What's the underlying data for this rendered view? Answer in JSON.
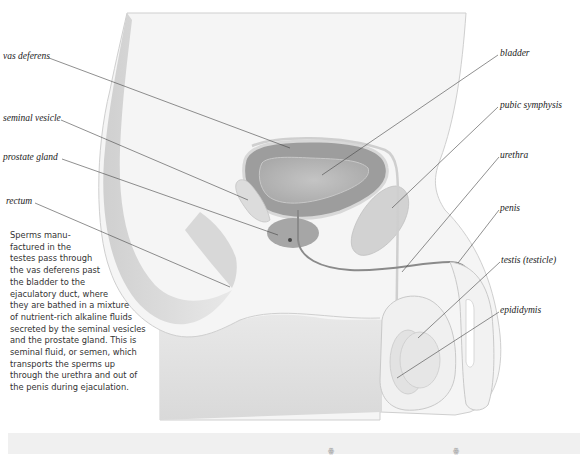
{
  "diagram": {
    "labels_left": [
      {
        "id": "vas-deferens",
        "text": "vas deferens"
      },
      {
        "id": "seminal-vesicle",
        "text": "seminal vesicle"
      },
      {
        "id": "prostate-gland",
        "text": "prostate gland"
      },
      {
        "id": "rectum",
        "text": "rectum"
      }
    ],
    "labels_right": [
      {
        "id": "bladder",
        "text": "bladder"
      },
      {
        "id": "pubic-symphysis",
        "text": "pubic symphysis"
      },
      {
        "id": "urethra",
        "text": "urethra"
      },
      {
        "id": "penis",
        "text": "penis"
      },
      {
        "id": "testis",
        "text": "testis (testicle)"
      },
      {
        "id": "epididymis",
        "text": "epididymis"
      }
    ],
    "caption_lines": [
      "Sperms manu-",
      "factured in the",
      "testes pass through",
      "the vas deferens past",
      "the bladder to the",
      "ejaculatory duct, where",
      "they are bathed in a mixture",
      "of nutrient-rich alkaline fluids",
      "secreted by the seminal vesicles",
      "and the prostate gland. This is",
      "seminal fluid, or semen, which",
      "transports the sperms up",
      "through the urethra and out of",
      "the penis during ejaculation."
    ],
    "bottom_strip_glyphs": [
      "ꙮ",
      "ꙮ"
    ],
    "colors": {
      "body_fill": "#f4f4f4",
      "outline": "#c8c8c8",
      "bladder_outer": "#9a9a9a",
      "bladder_inner": "#b4b4b4",
      "organ_light": "#d6d6d6",
      "lower_trunk": "#e2e2e2",
      "leader_line": "#444444",
      "label_text": "#222222",
      "strip": "#f0f0f0"
    }
  }
}
